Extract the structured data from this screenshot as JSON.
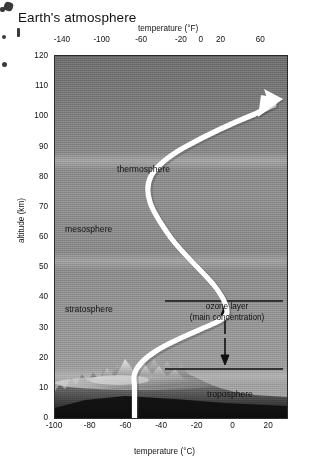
{
  "title": "Earth's atmosphere",
  "chart_data": {
    "type": "line",
    "title": "Earth's atmosphere",
    "xlabel": "temperature (°C)",
    "xlabel_top": "temperature (°F)",
    "ylabel": "altitude (km)",
    "xlim": [
      -100,
      30
    ],
    "ylim": [
      0,
      120
    ],
    "grid": false,
    "legend": "none",
    "xticks_bottom": [
      "-100",
      "-80",
      "-60",
      "-40",
      "-20",
      "0",
      "20"
    ],
    "xticks_bottom_values": [
      -100,
      -80,
      -60,
      -40,
      -20,
      0,
      20
    ],
    "xticks_top": [
      "-140",
      "-100",
      "-60",
      "-20",
      "0",
      "20",
      "60"
    ],
    "xticks_top_values": [
      -140,
      -100,
      -60,
      -20,
      0,
      20,
      60
    ],
    "yticks": [
      "0",
      "10",
      "20",
      "30",
      "40",
      "50",
      "60",
      "70",
      "80",
      "90",
      "100",
      "110",
      "120"
    ],
    "yticks_values": [
      0,
      10,
      20,
      30,
      40,
      50,
      60,
      70,
      80,
      90,
      100,
      110,
      120
    ],
    "series": [
      {
        "name": "temperature profile",
        "color": "#ffffff",
        "arrow_head": "top-right",
        "points": [
          {
            "t": -56,
            "alt": 0
          },
          {
            "t": -56,
            "alt": 6
          },
          {
            "t": -72,
            "alt": 11
          },
          {
            "t": -70,
            "alt": 16
          },
          {
            "t": -55,
            "alt": 26
          },
          {
            "t": -30,
            "alt": 38
          },
          {
            "t": -3,
            "alt": 48
          },
          {
            "t": -2,
            "alt": 52
          },
          {
            "t": -20,
            "alt": 60
          },
          {
            "t": -55,
            "alt": 70
          },
          {
            "t": -85,
            "alt": 80
          },
          {
            "t": -92,
            "alt": 86
          },
          {
            "t": -85,
            "alt": 93
          },
          {
            "t": -58,
            "alt": 101
          },
          {
            "t": -20,
            "alt": 108
          },
          {
            "t": 22,
            "alt": 113
          }
        ]
      }
    ],
    "annotations": [
      {
        "name": "thermosphere",
        "text": "thermosphere",
        "alt": 84,
        "t": -72
      },
      {
        "name": "mesosphere",
        "text": "mesosphere",
        "alt": 64,
        "t": -95
      },
      {
        "name": "stratosphere",
        "text": "stratosphere",
        "alt": 38,
        "t": -95
      },
      {
        "name": "troposphere",
        "text": "troposphere",
        "alt": 10,
        "t": -22
      },
      {
        "name": "ozone-layer",
        "text_line1": "ozone layer",
        "text_line2": "(main concentration)",
        "alt_top": 40,
        "alt_bottom": 15
      }
    ],
    "layer_bands": [
      {
        "name": "mesopause",
        "alt": 88
      },
      {
        "name": "stratopause",
        "alt": 55
      },
      {
        "name": "tropopause",
        "alt": 16
      }
    ]
  },
  "labels": {
    "thermosphere": "thermosphere",
    "mesosphere": "mesosphere",
    "stratosphere": "stratosphere",
    "troposphere": "troposphere",
    "ozone_line1": "ozone layer",
    "ozone_line2": "(main concentration)"
  },
  "axes": {
    "top_title": "temperature (°F)",
    "bottom_title": "temperature (°C)",
    "left_title": "altitude (km)"
  },
  "ticks": {
    "top": [
      "-140",
      "-100",
      "-60",
      "-20",
      "0",
      "20",
      "60"
    ],
    "bottom": [
      "-100",
      "-80",
      "-60",
      "-40",
      "-20",
      "0",
      "20"
    ],
    "left": [
      "120",
      "110",
      "100",
      "90",
      "80",
      "70",
      "60",
      "50",
      "40",
      "30",
      "20",
      "10",
      "0"
    ]
  },
  "colors": {
    "curve": "#ffffff",
    "frame": "#2b2b2b",
    "plot_top": "#6f6f6f",
    "plot_bottom": "#a8a8a8",
    "text": "#111111",
    "page": "#ffffff"
  }
}
